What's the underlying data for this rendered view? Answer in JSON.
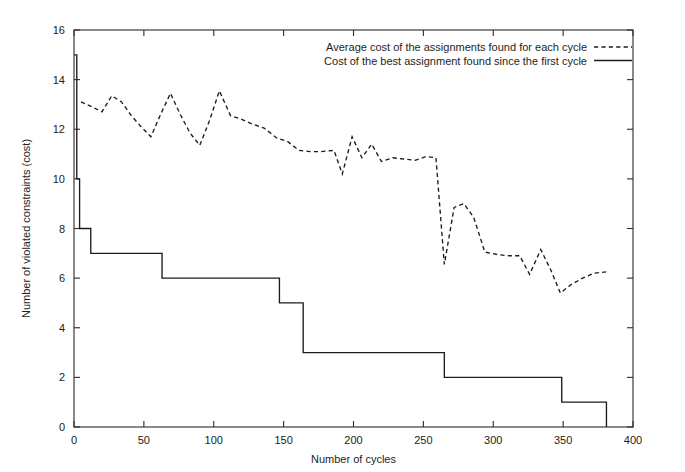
{
  "chart_data": {
    "type": "line",
    "title": "",
    "xlabel": "Number of cycles",
    "ylabel": "Number of violated constraints (cost)",
    "xlim": [
      0,
      400
    ],
    "ylim": [
      0,
      16
    ],
    "xticks": [
      0,
      50,
      100,
      150,
      200,
      250,
      300,
      350,
      400
    ],
    "xtick_labels": [
      "0",
      "50",
      "100",
      "150",
      "200",
      "250",
      "300",
      "350",
      "400"
    ],
    "yticks": [
      0,
      2,
      4,
      6,
      8,
      10,
      12,
      14,
      16
    ],
    "ytick_labels": [
      "0",
      "2",
      "4",
      "6",
      "8",
      "10",
      "12",
      "14",
      "16"
    ],
    "grid": false,
    "legend_position": "top-right",
    "series": [
      {
        "name": "Average cost of the assignments found for each cycle",
        "style": "dashed",
        "color": "#1c1c1c",
        "points": [
          [
            5,
            13.1
          ],
          [
            13,
            12.9
          ],
          [
            20,
            12.7
          ],
          [
            27,
            13.35
          ],
          [
            34,
            13.1
          ],
          [
            41,
            12.55
          ],
          [
            48,
            12.1
          ],
          [
            55,
            11.7
          ],
          [
            62,
            12.6
          ],
          [
            69,
            13.45
          ],
          [
            76,
            12.6
          ],
          [
            83,
            11.85
          ],
          [
            90,
            11.35
          ],
          [
            97,
            12.35
          ],
          [
            104,
            13.55
          ],
          [
            112,
            12.55
          ],
          [
            120,
            12.4
          ],
          [
            128,
            12.2
          ],
          [
            136,
            12.05
          ],
          [
            145,
            11.65
          ],
          [
            153,
            11.5
          ],
          [
            161,
            11.15
          ],
          [
            169,
            11.1
          ],
          [
            177,
            11.1
          ],
          [
            186,
            11.15
          ],
          [
            192,
            10.2
          ],
          [
            199,
            11.7
          ],
          [
            206,
            10.85
          ],
          [
            213,
            11.4
          ],
          [
            220,
            10.7
          ],
          [
            228,
            10.85
          ],
          [
            236,
            10.8
          ],
          [
            244,
            10.75
          ],
          [
            252,
            10.9
          ],
          [
            259,
            10.85
          ],
          [
            265,
            6.55
          ],
          [
            272,
            8.85
          ],
          [
            279,
            9.0
          ],
          [
            286,
            8.45
          ],
          [
            294,
            7.05
          ],
          [
            303,
            6.95
          ],
          [
            311,
            6.9
          ],
          [
            319,
            6.9
          ],
          [
            326,
            6.15
          ],
          [
            334,
            7.15
          ],
          [
            341,
            6.35
          ],
          [
            348,
            5.4
          ],
          [
            356,
            5.75
          ],
          [
            364,
            6.0
          ],
          [
            372,
            6.2
          ],
          [
            381,
            6.25
          ]
        ]
      },
      {
        "name": "Cost of the best assignment found since the first cycle",
        "style": "solid",
        "color": "#1c1c1c",
        "step": true,
        "points": [
          [
            0,
            15.0
          ],
          [
            2,
            10.0
          ],
          [
            4,
            8.0
          ],
          [
            12,
            7.0
          ],
          [
            63,
            6.0
          ],
          [
            147,
            5.0
          ],
          [
            164,
            3.0
          ],
          [
            265,
            2.0
          ],
          [
            349,
            1.0
          ],
          [
            381,
            1.0
          ],
          [
            381,
            0.0
          ]
        ]
      }
    ]
  },
  "legend": {
    "entries": [
      {
        "label": "Average cost of the assignments found for each cycle",
        "style": "dashed"
      },
      {
        "label": "Cost of the best assignment found since the first cycle",
        "style": "solid"
      }
    ]
  },
  "axes": {
    "x_title": "Number of cycles",
    "y_title": "Number of violated constraints (cost)"
  }
}
